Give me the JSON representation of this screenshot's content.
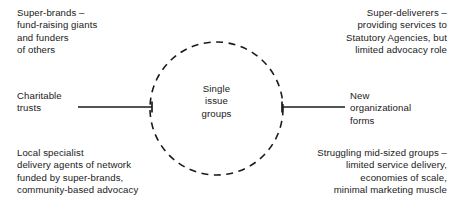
{
  "diagram": {
    "hub": {
      "label": "Single\nissue\ngroups",
      "shape": "dashed-circle",
      "center_x": 216.5,
      "center_y": 108.5,
      "radius": 66.5
    },
    "axis": {
      "left_label": "Charitable\ntrusts",
      "right_label": "New\norganizational\nforms",
      "line_color": "#1a1a1a"
    },
    "quadrants": [
      {
        "position": "top-left",
        "text": "Super-brands –\nfund-raising giants\nand funders\nof others"
      },
      {
        "position": "top-right",
        "text": "Super-deliverers –\nproviding services to\nStatutory Agencies, but\nlimited advocacy role"
      },
      {
        "position": "bottom-left",
        "text": "Local specialist\ndelivery agents of network\nfunded by super-brands,\ncommunity-based advocacy"
      },
      {
        "position": "bottom-right",
        "text": "Struggling mid-sized groups –\nlimited service delivery,\neconomies of scale,\nminimal marketing muscle"
      }
    ]
  }
}
